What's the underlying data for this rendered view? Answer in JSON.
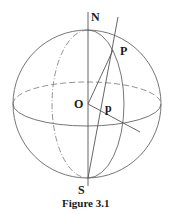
{
  "figure": {
    "caption": "Figure 3.1",
    "labels": {
      "north": "N",
      "south": "S",
      "center": "O",
      "point_upper": "P",
      "point_lower": "p"
    },
    "colors": {
      "stroke": "#555555",
      "text": "#1a1a1a",
      "background": "#ffffff"
    }
  }
}
